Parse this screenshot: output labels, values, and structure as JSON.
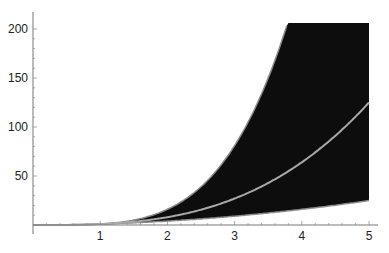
{
  "chart_data": {
    "type": "area",
    "title": "",
    "xlabel": "",
    "ylabel": "",
    "xlim": [
      0,
      5
    ],
    "ylim": [
      0,
      206
    ],
    "grid": false,
    "legend": null,
    "x_ticks": [
      1,
      2,
      3,
      4,
      5
    ],
    "y_ticks": [
      50,
      100,
      150,
      200
    ],
    "x_tick_labels": [
      "1",
      "2",
      "3",
      "4",
      "5"
    ],
    "y_tick_labels": [
      "50",
      "100",
      "150",
      "200"
    ],
    "series": [
      {
        "name": "lower bound (x^2)",
        "role": "band-lower",
        "x": [
          0,
          1,
          2,
          3,
          4,
          5
        ],
        "values": [
          0,
          1,
          4,
          9,
          16,
          25
        ]
      },
      {
        "name": "center line (x^3)",
        "role": "line",
        "x": [
          0,
          1,
          2,
          3,
          4,
          5
        ],
        "values": [
          0,
          1,
          8,
          27,
          64,
          125
        ]
      },
      {
        "name": "upper bound (x^4)",
        "role": "band-upper",
        "x": [
          0,
          1,
          2,
          3,
          3.8,
          4,
          5
        ],
        "values": [
          0,
          1,
          16,
          81,
          208,
          256,
          625
        ],
        "clipped_at": 206
      }
    ],
    "colors": {
      "band_fill": "#0d0d0d",
      "band_edge": "#8a8a8a",
      "center_line": "#a8a8a8",
      "axis": "#777777"
    }
  }
}
